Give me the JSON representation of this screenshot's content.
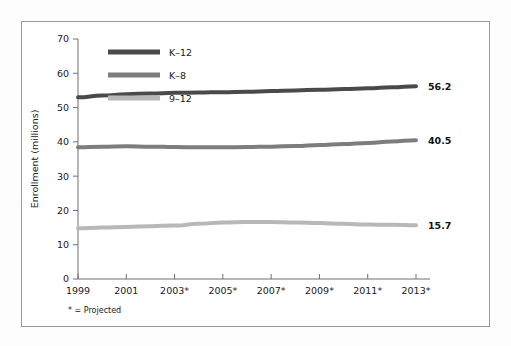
{
  "chart_data": {
    "type": "line",
    "title": "",
    "xlabel": "",
    "ylabel": "Enrollment (millions)",
    "ylim": [
      0,
      70
    ],
    "yticks": [
      0,
      10,
      20,
      30,
      40,
      50,
      60,
      70
    ],
    "grid": false,
    "legend_position": "top-left",
    "x": [
      1999,
      2000,
      2001,
      2002,
      2003,
      2004,
      2005,
      2006,
      2007,
      2008,
      2009,
      2010,
      2011,
      2012,
      2013
    ],
    "xtick_labels": [
      "1999",
      "2001",
      "2003*",
      "2005*",
      "2007*",
      "2009*",
      "2011*",
      "2013*"
    ],
    "xtick_values": [
      1999,
      2001,
      2003,
      2005,
      2007,
      2009,
      2011,
      2013
    ],
    "series": [
      {
        "name": "K-12",
        "legend_label": "K–12",
        "color": "#4a4a4a",
        "end_label": "56.2",
        "values": [
          53.0,
          53.5,
          53.9,
          54.1,
          54.3,
          54.4,
          54.5,
          54.6,
          54.8,
          55.0,
          55.2,
          55.4,
          55.6,
          55.9,
          56.2
        ]
      },
      {
        "name": "K-8",
        "legend_label": "K–8",
        "color": "#7d7d7d",
        "end_label": "40.5",
        "values": [
          38.4,
          38.6,
          38.7,
          38.6,
          38.5,
          38.4,
          38.4,
          38.5,
          38.6,
          38.8,
          39.1,
          39.4,
          39.7,
          40.1,
          40.5
        ]
      },
      {
        "name": "9-12",
        "legend_label": "9–12",
        "color": "#b8b8b8",
        "end_label": "15.7",
        "values": [
          14.8,
          15.0,
          15.2,
          15.4,
          15.6,
          16.1,
          16.5,
          16.6,
          16.6,
          16.5,
          16.3,
          16.1,
          15.9,
          15.8,
          15.7
        ]
      }
    ],
    "footnote": "* = Projected"
  },
  "colors": {
    "frame_border": "#9a9a9a",
    "axis": "#6f6f6f",
    "text": "#1a1a1a",
    "background": "#ffffff"
  }
}
